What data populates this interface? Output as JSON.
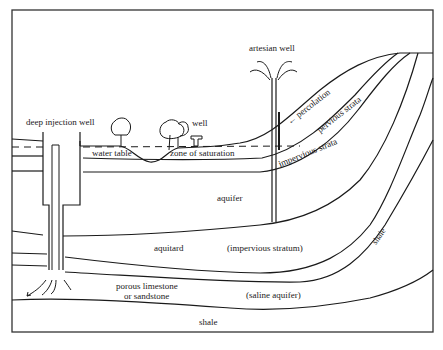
{
  "diagram": {
    "type": "geological cross-section",
    "labels": {
      "deep_injection_well": "deep injection well",
      "artesian_well": "artesian well",
      "well": "well",
      "water_table": "water table",
      "zone_of_saturation": "zone of saturation",
      "percolation": "← percolation",
      "pervious_strata": "pervious  strata",
      "impervious_strata": "impervious strata",
      "aquifer": "aquifer",
      "aquitard": "aquitard",
      "impervious_stratum": "(impervious stratum)",
      "shale_curve": "shale",
      "porous_limestone_1": "porous limestone",
      "porous_limestone_2": "or sandstone",
      "saline_aquifer": "(saline aquifer)",
      "shale_bottom": "shale"
    },
    "colors": {
      "ink": "#1a1a1a",
      "background": "#ffffff"
    }
  }
}
